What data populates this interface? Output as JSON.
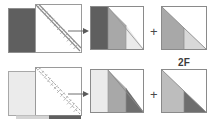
{
  "figure": {
    "width": 208,
    "height": 125,
    "background": "#ffffff",
    "label_2f": "2F",
    "plus_sign": "+",
    "arrow_glyph": "→"
  },
  "colors": {
    "dark_gray": "#5f5f5f",
    "mid_gray": "#8a8a8a",
    "light_gray": "#b4b4b4",
    "pale_gray": "#d8d8d8",
    "very_pale": "#ebebeb",
    "white": "#ffffff",
    "outline": "#9a9a9a",
    "outline_dark": "#707070",
    "diagonal_line": "#7a7a7a",
    "arrow": "#6e6e6e",
    "text": "#3c3c3c",
    "background": "#ffffff"
  },
  "rows": [
    {
      "id": "row-top",
      "name": "first-decomposition",
      "diagonal_style": "solid",
      "source": {
        "name": "source-matrix-top",
        "left_block_fill": "#5f5f5f",
        "right_block_fill": "#ffffff",
        "split_fraction": 0.42,
        "diagonal": "solid",
        "hatch": true
      },
      "arrow": {
        "name": "arrow-top",
        "direction": "right"
      },
      "result": {
        "name": "result-matrix-top",
        "bands": [
          "#5f5f5f",
          "#a8a8a8",
          "#ebebeb"
        ],
        "triangle_fill": "#ffffff",
        "has_diagonal": true
      },
      "addend": {
        "name": "addend-triangle-top",
        "lower_left_fill": "#a8a8a8",
        "lower_right_fill": "#d8d8d8",
        "upper_fill": "#ffffff"
      }
    },
    {
      "id": "row-bottom",
      "name": "second-decomposition",
      "diagonal_style": "dashed",
      "source": {
        "name": "source-matrix-bottom",
        "left_block_fill": "#ebebeb",
        "right_block_fill": "#ffffff",
        "split_fraction": 0.42,
        "diagonal": "dashed",
        "hatch": true,
        "bottom_bar_fill": "#5f5f5f"
      },
      "arrow": {
        "name": "arrow-bottom",
        "direction": "right"
      },
      "result": {
        "name": "result-matrix-bottom",
        "bands": [
          "#ebebeb",
          "#a8a8a8",
          "#6e6e6e"
        ],
        "triangle_fill": "#ffffff",
        "has_diagonal": true
      },
      "addend": {
        "name": "addend-triangle-bottom",
        "lower_left_fill": "#bdbdbd",
        "lower_right_fill": "#6e6e6e",
        "upper_fill": "#ffffff"
      }
    }
  ]
}
